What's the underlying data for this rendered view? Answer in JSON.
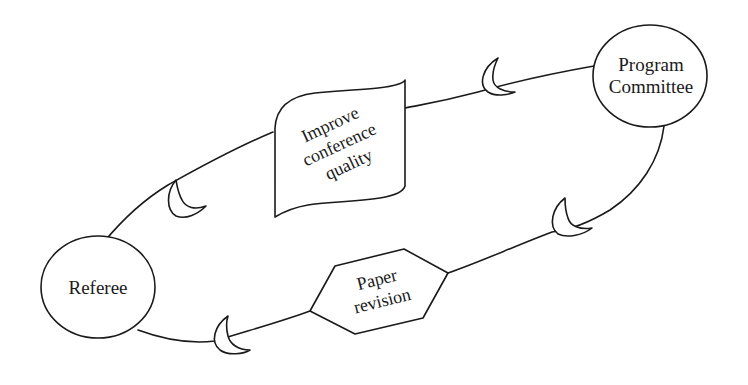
{
  "diagram": {
    "type": "cycle",
    "colors": {
      "stroke": "#1a1a1a",
      "background": "#ffffff"
    },
    "nodes": [
      {
        "id": "program-committee",
        "shape": "circle",
        "lines": [
          "Program",
          "Committee"
        ]
      },
      {
        "id": "referee",
        "shape": "circle",
        "lines": [
          "Referee"
        ]
      },
      {
        "id": "improve-quality",
        "shape": "wave-flag",
        "lines": [
          "Improve",
          "conference",
          "quality"
        ]
      },
      {
        "id": "paper-revision",
        "shape": "hexagon",
        "lines": [
          "Paper",
          "revision"
        ]
      }
    ],
    "edges": [
      {
        "from": "program-committee",
        "to": "improve-quality",
        "arrow": "crescent"
      },
      {
        "from": "improve-quality",
        "to": "referee",
        "arrow": "crescent"
      },
      {
        "from": "program-committee",
        "to": "paper-revision",
        "arrow": "crescent"
      },
      {
        "from": "paper-revision",
        "to": "referee",
        "arrow": "crescent"
      }
    ]
  }
}
